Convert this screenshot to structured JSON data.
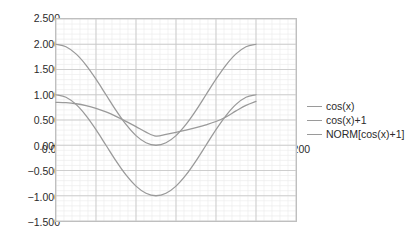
{
  "chart_data": {
    "type": "line",
    "title": "",
    "xlabel": "",
    "ylabel": "",
    "xlim": [
      0.0,
      1.2
    ],
    "ylim": [
      -1.5,
      2.5
    ],
    "grid": true,
    "minor_grid": true,
    "legend_position": "right",
    "x_ticks": [
      "0.000",
      "0.200",
      "0.400",
      "0.600",
      "0.800",
      "1.000",
      "1.200"
    ],
    "x_tick_values": [
      0.0,
      0.2,
      0.4,
      0.6,
      0.8,
      1.0,
      1.2
    ],
    "y_ticks": [
      "2.500",
      "2.000",
      "1.500",
      "1.000",
      "0.500",
      "0.000",
      "-0.500",
      "-1.000",
      "-1.500"
    ],
    "y_tick_values": [
      2.5,
      2.0,
      1.5,
      1.0,
      0.5,
      0.0,
      -0.5,
      -1.0,
      -1.5
    ],
    "x": [
      0.0,
      0.05,
      0.1,
      0.15,
      0.2,
      0.25,
      0.3,
      0.35,
      0.4,
      0.45,
      0.5,
      0.55,
      0.6,
      0.65,
      0.7,
      0.75,
      0.8,
      0.85,
      0.9,
      0.95,
      1.0
    ],
    "series": [
      {
        "name": "cos(x)",
        "color": "#9a9a9a",
        "values": [
          1.0,
          0.951,
          0.809,
          0.588,
          0.309,
          0.0,
          -0.309,
          -0.588,
          -0.809,
          -0.951,
          -1.0,
          -0.951,
          -0.809,
          -0.588,
          -0.309,
          0.0,
          0.309,
          0.588,
          0.809,
          0.951,
          1.0
        ]
      },
      {
        "name": "cos(x)+1",
        "color": "#9a9a9a",
        "values": [
          2.0,
          1.951,
          1.809,
          1.588,
          1.309,
          1.0,
          0.691,
          0.412,
          0.191,
          0.049,
          0.0,
          0.049,
          0.191,
          0.412,
          0.691,
          1.0,
          1.309,
          1.588,
          1.809,
          1.951,
          2.0
        ]
      },
      {
        "name": "NORM[cos(x)+1]",
        "color": "#9a9a9a",
        "values": [
          0.85,
          0.843,
          0.822,
          0.785,
          0.731,
          0.66,
          0.572,
          0.474,
          0.37,
          0.26,
          0.18,
          0.215,
          0.255,
          0.3,
          0.35,
          0.405,
          0.47,
          0.56,
          0.68,
          0.79,
          0.87
        ]
      }
    ],
    "legend_entries": [
      "cos(x)",
      "cos(x)+1",
      "NORM[cos(x)+1]"
    ]
  },
  "colors": {
    "background": "#ffffff",
    "plot_border": "#bfbfbf",
    "major_grid": "#c9c9c9",
    "minor_grid": "#ececec",
    "series_line": "#9a9a9a",
    "tick_text": "#2b2b2b"
  }
}
